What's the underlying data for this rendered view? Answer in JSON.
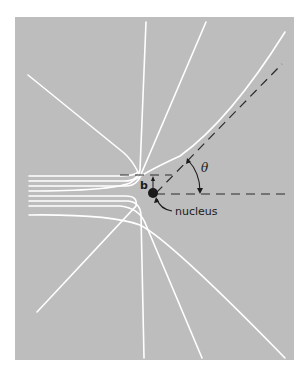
{
  "diagram": {
    "type": "rutherford-scattering",
    "background_color": "#bdbdbd",
    "line_color": "#ffffff",
    "labels": {
      "impact_parameter": "b",
      "angle": "θ",
      "nucleus": "nucleus"
    },
    "incoming_trajectories": 8,
    "scattered_trajectories": 8
  }
}
